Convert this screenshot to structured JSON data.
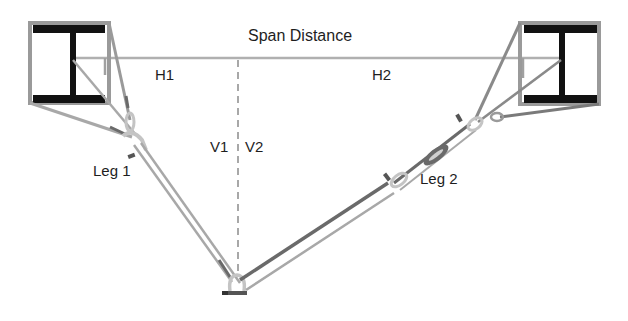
{
  "labels": {
    "span_distance": "Span Distance",
    "h1": "H1",
    "h2": "H2",
    "v1": "V1",
    "v2": "V2",
    "leg1": "Leg 1",
    "leg2": "Leg 2"
  },
  "colors": {
    "beam": "#111111",
    "frame": "#9a9a9a",
    "sling_light": "#a8a8a8",
    "sling_dark": "#6a6a6a",
    "hardware": "#c4c4c4",
    "text": "#1e1e1e",
    "dashed": "#8c8c8c"
  },
  "components": {
    "left_beam": "I-beam (left anchor)",
    "right_beam": "I-beam (right anchor)",
    "turnbuckle": "turnbuckle on Leg 2",
    "shackles": [
      "left shackle",
      "bottom shackle",
      "leg 2 shackle",
      "right shackle"
    ]
  }
}
